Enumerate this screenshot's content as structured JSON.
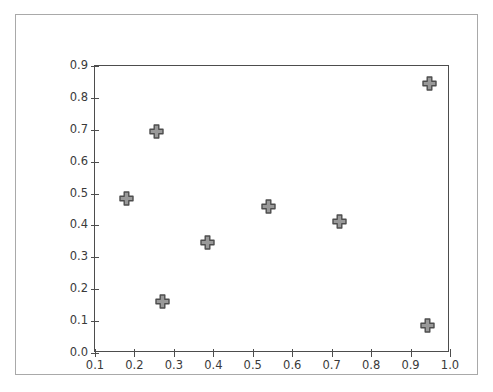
{
  "chart_data": {
    "type": "scatter",
    "title": "",
    "xlabel": "",
    "ylabel": "",
    "xlim": [
      0.1,
      1.0
    ],
    "ylim": [
      0.0,
      0.9
    ],
    "grid": false,
    "legend": null,
    "marker": {
      "shape": "filled-plus",
      "face_color": "#999999",
      "edge_color": "#4d4d4d",
      "size_px": 15
    },
    "xticks": [
      "0.1",
      "0.2",
      "0.3",
      "0.4",
      "0.5",
      "0.6",
      "0.7",
      "0.8",
      "0.9",
      "1.0"
    ],
    "xtick_values": [
      0.1,
      0.2,
      0.3,
      0.4,
      0.5,
      0.6,
      0.7,
      0.8,
      0.9,
      1.0
    ],
    "yticks": [
      "0.0",
      "0.1",
      "0.2",
      "0.3",
      "0.4",
      "0.5",
      "0.6",
      "0.7",
      "0.8",
      "0.9"
    ],
    "ytick_values": [
      0.0,
      0.1,
      0.2,
      0.3,
      0.4,
      0.5,
      0.6,
      0.7,
      0.8,
      0.9
    ],
    "points": [
      {
        "x": 0.181,
        "y": 0.485
      },
      {
        "x": 0.255,
        "y": 0.696
      },
      {
        "x": 0.27,
        "y": 0.163
      },
      {
        "x": 0.384,
        "y": 0.348
      },
      {
        "x": 0.539,
        "y": 0.458
      },
      {
        "x": 0.719,
        "y": 0.411
      },
      {
        "x": 0.947,
        "y": 0.844
      },
      {
        "x": 0.944,
        "y": 0.085
      }
    ],
    "x": [
      0.181,
      0.255,
      0.27,
      0.384,
      0.539,
      0.719,
      0.947,
      0.944
    ],
    "values": [
      0.485,
      0.696,
      0.163,
      0.348,
      0.458,
      0.411,
      0.844,
      0.085
    ]
  },
  "figure": {
    "background_color": "#ffffff",
    "frame_color": "#a9a9a9",
    "axes_edge_color": "#4d4d4d",
    "tick_label_color": "#3a3a3a"
  }
}
